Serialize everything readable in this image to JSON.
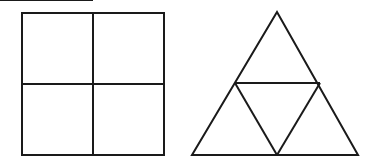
{
  "canvas": {
    "width": 374,
    "height": 167,
    "background_color": "#ffffff",
    "stroke_color": "#1a1a1a",
    "stroke_width": 2
  },
  "figures": [
    {
      "id": "square-figure",
      "name": "square-divided-into-four-quadrants",
      "shape": "square",
      "parts": 4,
      "outline": {
        "x": 22,
        "y": 13,
        "width": 142,
        "height": 142,
        "points": "22,13 164,13 164,155 22,155"
      },
      "dividers": [
        {
          "name": "vertical-midline",
          "x1": 93,
          "y1": 13,
          "x2": 93,
          "y2": 155
        },
        {
          "name": "horizontal-midline",
          "x1": 22,
          "y1": 84,
          "x2": 164,
          "y2": 84
        }
      ]
    },
    {
      "id": "triangle-figure",
      "name": "triangle-divided-into-four-triangles",
      "shape": "triangle",
      "parts": 4,
      "outline": {
        "apex": {
          "x": 277,
          "y": 12
        },
        "base_left": {
          "x": 192,
          "y": 155
        },
        "base_right": {
          "x": 358,
          "y": 155
        },
        "points": "277,12 358,155 192,155"
      },
      "midpoints": {
        "left_side": {
          "x": 235,
          "y": 83
        },
        "right_side": {
          "x": 320,
          "y": 83
        },
        "base": {
          "x": 277,
          "y": 155
        }
      },
      "dividers": [
        {
          "name": "midsegment-horizontal",
          "x1": 235,
          "y1": 83,
          "x2": 320,
          "y2": 83
        },
        {
          "name": "midsegment-left-diagonal",
          "x1": 235,
          "y1": 83,
          "x2": 277,
          "y2": 155
        },
        {
          "name": "midsegment-right-diagonal",
          "x1": 320,
          "y1": 83,
          "x2": 277,
          "y2": 155
        }
      ]
    }
  ]
}
